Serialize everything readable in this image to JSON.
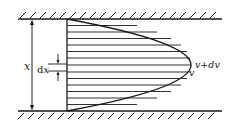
{
  "diagram": {
    "type": "velocity-profile-between-parallel-plates",
    "labels": {
      "height": "x",
      "differential_height_prefix": "d",
      "differential_height_var": "x",
      "velocity": "v",
      "velocity_plus_differential": "v+dv"
    },
    "colors": {
      "stroke": "#1a1a1a",
      "background": "#ffffff"
    },
    "hatch_line_count": 13
  }
}
